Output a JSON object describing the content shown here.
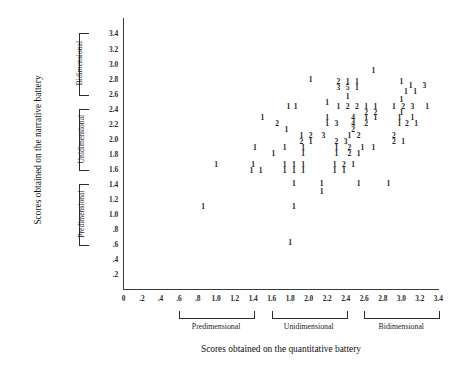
{
  "chart_data": {
    "type": "scatter",
    "title": "",
    "xlabel": "Scores obtained on the quantitative battery",
    "ylabel": "Scores obtained on the narrative battery",
    "xlim": [
      0,
      3.4
    ],
    "ylim": [
      0,
      3.5
    ],
    "grid": false,
    "legend": null,
    "point_encoding": "Each plotted digit is the count of cases at that (x, y) coordinate",
    "xticks": [
      "0",
      ".2",
      ".4",
      ".6",
      ".8",
      "1.0",
      "1.2",
      "1.4",
      "1.6",
      "1.8",
      "2.0",
      "2.2",
      "2.4",
      "2.6",
      "2.8",
      "3.0",
      "3.2",
      "3.4"
    ],
    "xtick_values": [
      0,
      0.2,
      0.4,
      0.6,
      0.8,
      1.0,
      1.2,
      1.4,
      1.6,
      1.8,
      2.0,
      2.2,
      2.4,
      2.6,
      2.8,
      3.0,
      3.2,
      3.4
    ],
    "yticks": [
      ".2",
      ".4",
      ".6",
      ".8",
      "1.0",
      "1.2",
      "1.4",
      "1.6",
      "1.8",
      "2.0",
      "2.2",
      "2.4",
      "2.6",
      "2.8",
      "3.0",
      "3.2",
      "3.4"
    ],
    "ytick_values": [
      0.2,
      0.4,
      0.6,
      0.8,
      1.0,
      1.2,
      1.4,
      1.6,
      1.8,
      2.0,
      2.2,
      2.4,
      2.6,
      2.8,
      3.0,
      3.2,
      3.4
    ],
    "x_groups": [
      {
        "label": "Predimensional",
        "from": 0.6,
        "to": 1.4
      },
      {
        "label": "Unidimensional",
        "from": 1.6,
        "to": 2.4
      },
      {
        "label": "Bidimensional",
        "from": 2.6,
        "to": 3.4
      }
    ],
    "y_groups": [
      {
        "label": "Predimensional",
        "from": 0.6,
        "to": 1.4
      },
      {
        "label": "Unidimensional",
        "from": 1.6,
        "to": 2.4
      },
      {
        "label": "Bidimensional",
        "from": 2.6,
        "to": 3.4
      }
    ],
    "points": [
      {
        "x": 2.7,
        "y": 2.9,
        "count": 1
      },
      {
        "x": 3.0,
        "y": 2.75,
        "count": 1
      },
      {
        "x": 3.1,
        "y": 2.7,
        "count": 1
      },
      {
        "x": 3.25,
        "y": 2.7,
        "count": 3
      },
      {
        "x": 3.05,
        "y": 2.62,
        "count": 1
      },
      {
        "x": 3.15,
        "y": 2.62,
        "count": 1
      },
      {
        "x": 2.02,
        "y": 2.78,
        "count": 1
      },
      {
        "x": 2.32,
        "y": 2.75,
        "count": 2
      },
      {
        "x": 2.42,
        "y": 2.75,
        "count": 1
      },
      {
        "x": 2.52,
        "y": 2.75,
        "count": 1
      },
      {
        "x": 2.32,
        "y": 2.68,
        "count": 3
      },
      {
        "x": 2.42,
        "y": 2.68,
        "count": 5
      },
      {
        "x": 2.52,
        "y": 2.68,
        "count": 1
      },
      {
        "x": 2.42,
        "y": 2.55,
        "count": 1
      },
      {
        "x": 3.0,
        "y": 2.52,
        "count": 1
      },
      {
        "x": 2.2,
        "y": 2.48,
        "count": 1
      },
      {
        "x": 1.78,
        "y": 2.42,
        "count": 1
      },
      {
        "x": 1.86,
        "y": 2.42,
        "count": 1
      },
      {
        "x": 2.32,
        "y": 2.42,
        "count": 1
      },
      {
        "x": 2.42,
        "y": 2.42,
        "count": 2
      },
      {
        "x": 2.52,
        "y": 2.42,
        "count": 2
      },
      {
        "x": 2.62,
        "y": 2.42,
        "count": 1
      },
      {
        "x": 2.72,
        "y": 2.42,
        "count": 1
      },
      {
        "x": 2.92,
        "y": 2.42,
        "count": 1
      },
      {
        "x": 3.02,
        "y": 2.42,
        "count": 2
      },
      {
        "x": 3.12,
        "y": 2.42,
        "count": 3
      },
      {
        "x": 3.28,
        "y": 2.42,
        "count": 1
      },
      {
        "x": 2.62,
        "y": 2.34,
        "count": 2
      },
      {
        "x": 2.72,
        "y": 2.34,
        "count": 2
      },
      {
        "x": 3.0,
        "y": 2.34,
        "count": 1
      },
      {
        "x": 1.5,
        "y": 2.28,
        "count": 1
      },
      {
        "x": 2.2,
        "y": 2.28,
        "count": 1
      },
      {
        "x": 2.48,
        "y": 2.28,
        "count": 4
      },
      {
        "x": 2.62,
        "y": 2.28,
        "count": 1
      },
      {
        "x": 2.72,
        "y": 2.28,
        "count": 1
      },
      {
        "x": 2.98,
        "y": 2.28,
        "count": 1
      },
      {
        "x": 3.12,
        "y": 2.28,
        "count": 1
      },
      {
        "x": 1.66,
        "y": 2.2,
        "count": 2
      },
      {
        "x": 2.2,
        "y": 2.2,
        "count": 1
      },
      {
        "x": 2.3,
        "y": 2.2,
        "count": 3
      },
      {
        "x": 2.48,
        "y": 2.2,
        "count": 4
      },
      {
        "x": 2.62,
        "y": 2.2,
        "count": 2
      },
      {
        "x": 2.98,
        "y": 2.2,
        "count": 1
      },
      {
        "x": 3.06,
        "y": 2.2,
        "count": 2
      },
      {
        "x": 3.16,
        "y": 2.2,
        "count": 1
      },
      {
        "x": 1.76,
        "y": 2.12,
        "count": 1
      },
      {
        "x": 2.48,
        "y": 2.12,
        "count": 2
      },
      {
        "x": 1.92,
        "y": 2.04,
        "count": 1
      },
      {
        "x": 2.02,
        "y": 2.04,
        "count": 2
      },
      {
        "x": 2.16,
        "y": 2.04,
        "count": 3
      },
      {
        "x": 2.44,
        "y": 2.04,
        "count": 1
      },
      {
        "x": 2.54,
        "y": 2.04,
        "count": 2
      },
      {
        "x": 2.92,
        "y": 2.04,
        "count": 2
      },
      {
        "x": 1.92,
        "y": 1.96,
        "count": 2
      },
      {
        "x": 2.02,
        "y": 1.96,
        "count": 1
      },
      {
        "x": 2.3,
        "y": 1.96,
        "count": 2
      },
      {
        "x": 2.4,
        "y": 1.96,
        "count": 3
      },
      {
        "x": 2.92,
        "y": 1.96,
        "count": 2
      },
      {
        "x": 3.02,
        "y": 1.96,
        "count": 1
      },
      {
        "x": 1.42,
        "y": 1.88,
        "count": 1
      },
      {
        "x": 1.74,
        "y": 1.88,
        "count": 1
      },
      {
        "x": 1.94,
        "y": 1.88,
        "count": 1
      },
      {
        "x": 2.3,
        "y": 1.88,
        "count": 1
      },
      {
        "x": 2.44,
        "y": 1.88,
        "count": 2
      },
      {
        "x": 2.58,
        "y": 1.88,
        "count": 1
      },
      {
        "x": 2.7,
        "y": 1.88,
        "count": 1
      },
      {
        "x": 1.62,
        "y": 1.8,
        "count": 1
      },
      {
        "x": 1.94,
        "y": 1.8,
        "count": 1
      },
      {
        "x": 2.3,
        "y": 1.8,
        "count": 1
      },
      {
        "x": 2.44,
        "y": 1.8,
        "count": 2
      },
      {
        "x": 2.54,
        "y": 1.8,
        "count": 1
      },
      {
        "x": 1.0,
        "y": 1.66,
        "count": 1
      },
      {
        "x": 1.4,
        "y": 1.66,
        "count": 1
      },
      {
        "x": 1.74,
        "y": 1.66,
        "count": 1
      },
      {
        "x": 1.84,
        "y": 1.66,
        "count": 1
      },
      {
        "x": 1.94,
        "y": 1.66,
        "count": 1
      },
      {
        "x": 2.28,
        "y": 1.66,
        "count": 1
      },
      {
        "x": 2.38,
        "y": 1.66,
        "count": 2
      },
      {
        "x": 2.48,
        "y": 1.66,
        "count": 1
      },
      {
        "x": 1.38,
        "y": 1.58,
        "count": 1
      },
      {
        "x": 1.48,
        "y": 1.58,
        "count": 1
      },
      {
        "x": 1.74,
        "y": 1.58,
        "count": 1
      },
      {
        "x": 1.84,
        "y": 1.58,
        "count": 1
      },
      {
        "x": 1.94,
        "y": 1.58,
        "count": 1
      },
      {
        "x": 2.28,
        "y": 1.58,
        "count": 1
      },
      {
        "x": 2.38,
        "y": 1.58,
        "count": 1
      },
      {
        "x": 1.84,
        "y": 1.4,
        "count": 1
      },
      {
        "x": 2.14,
        "y": 1.4,
        "count": 1
      },
      {
        "x": 2.54,
        "y": 1.4,
        "count": 1
      },
      {
        "x": 2.86,
        "y": 1.4,
        "count": 1
      },
      {
        "x": 2.14,
        "y": 1.3,
        "count": 1
      },
      {
        "x": 0.86,
        "y": 1.1,
        "count": 1
      },
      {
        "x": 1.84,
        "y": 1.1,
        "count": 1
      },
      {
        "x": 1.8,
        "y": 0.62,
        "count": 1
      }
    ]
  }
}
